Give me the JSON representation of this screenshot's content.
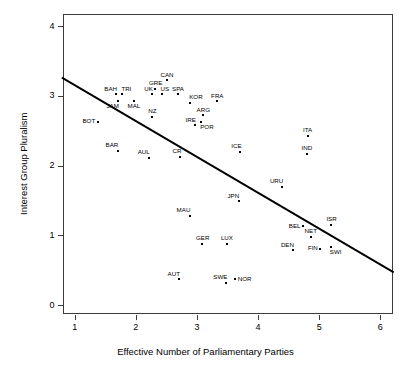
{
  "chart_data": {
    "type": "scatter",
    "title": "",
    "xlabel": "Effective Number of Parliamentary Parties",
    "ylabel": "Interest Group Pluralism",
    "xlim": [
      0.8,
      6.2
    ],
    "ylim": [
      -0.12,
      4.18
    ],
    "xticks": [
      1,
      2,
      3,
      4,
      5,
      6
    ],
    "yticks": [
      0,
      1,
      2,
      3,
      4
    ],
    "grid": false,
    "legend": null,
    "trendline": {
      "type": "linear",
      "x": [
        0.79,
        6.22
      ],
      "y": [
        3.26,
        0.47
      ],
      "color": "#000000"
    },
    "points": [
      {
        "label": "BOT",
        "x": 1.38,
        "y": 2.63,
        "label_pos": "left"
      },
      {
        "label": "BAH",
        "x": 1.68,
        "y": 3.02,
        "label_pos": "above-left"
      },
      {
        "label": "TRI",
        "x": 1.78,
        "y": 3.02,
        "label_pos": "above-right"
      },
      {
        "label": "JAM",
        "x": 1.7,
        "y": 2.93,
        "label_pos": "below-left"
      },
      {
        "label": "MAL",
        "x": 1.97,
        "y": 2.93,
        "label_pos": "below"
      },
      {
        "label": "BAR",
        "x": 1.7,
        "y": 2.21,
        "label_pos": "above-left"
      },
      {
        "label": "AUL",
        "x": 2.21,
        "y": 2.11,
        "label_pos": "above-left"
      },
      {
        "label": "NZ",
        "x": 2.27,
        "y": 2.7,
        "label_pos": "above"
      },
      {
        "label": "UK",
        "x": 2.27,
        "y": 3.02,
        "label_pos": "above-left"
      },
      {
        "label": "GRE",
        "x": 2.32,
        "y": 3.1,
        "label_pos": "above"
      },
      {
        "label": "US",
        "x": 2.42,
        "y": 3.02,
        "label_pos": "above-right"
      },
      {
        "label": "CAN",
        "x": 2.51,
        "y": 3.22,
        "label_pos": "above"
      },
      {
        "label": "SPA",
        "x": 2.69,
        "y": 3.02,
        "label_pos": "above"
      },
      {
        "label": "CR",
        "x": 2.73,
        "y": 2.13,
        "label_pos": "above-left"
      },
      {
        "label": "AUT",
        "x": 2.7,
        "y": 0.37,
        "label_pos": "above-left"
      },
      {
        "label": "KOR",
        "x": 2.89,
        "y": 2.9,
        "label_pos": "above-right"
      },
      {
        "label": "MAU",
        "x": 2.88,
        "y": 1.28,
        "label_pos": "above-left"
      },
      {
        "label": "IRE",
        "x": 2.96,
        "y": 2.58,
        "label_pos": "above-left"
      },
      {
        "label": "POR",
        "x": 3.07,
        "y": 2.63,
        "label_pos": "below-right"
      },
      {
        "label": "ARG",
        "x": 3.1,
        "y": 2.72,
        "label_pos": "above"
      },
      {
        "label": "GER",
        "x": 3.09,
        "y": 0.88,
        "label_pos": "above"
      },
      {
        "label": "FRA",
        "x": 3.33,
        "y": 2.92,
        "label_pos": "above"
      },
      {
        "label": "LUX",
        "x": 3.49,
        "y": 0.88,
        "label_pos": "above"
      },
      {
        "label": "SWE",
        "x": 3.48,
        "y": 0.32,
        "label_pos": "above-left"
      },
      {
        "label": "NOR",
        "x": 3.62,
        "y": 0.37,
        "label_pos": "right"
      },
      {
        "label": "JPN",
        "x": 3.68,
        "y": 1.49,
        "label_pos": "above-left"
      },
      {
        "label": "ICE",
        "x": 3.71,
        "y": 2.2,
        "label_pos": "above-left"
      },
      {
        "label": "URU",
        "x": 4.39,
        "y": 1.7,
        "label_pos": "above-left"
      },
      {
        "label": "DEN",
        "x": 4.57,
        "y": 0.79,
        "label_pos": "above-left"
      },
      {
        "label": "BEL",
        "x": 4.74,
        "y": 1.13,
        "label_pos": "left"
      },
      {
        "label": "ITA",
        "x": 4.81,
        "y": 2.43,
        "label_pos": "above"
      },
      {
        "label": "IND",
        "x": 4.8,
        "y": 2.17,
        "label_pos": "above"
      },
      {
        "label": "NET",
        "x": 4.86,
        "y": 0.98,
        "label_pos": "above"
      },
      {
        "label": "FIN",
        "x": 5.02,
        "y": 0.81,
        "label_pos": "left"
      },
      {
        "label": "SWI",
        "x": 5.19,
        "y": 0.84,
        "label_pos": "below-right"
      },
      {
        "label": "ISR",
        "x": 5.2,
        "y": 1.15,
        "label_pos": "above"
      }
    ]
  }
}
